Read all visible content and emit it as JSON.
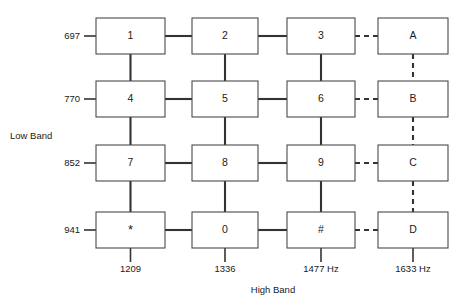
{
  "diagram": {
    "low_band_caption": "Low Band",
    "high_band_caption": "High Band",
    "line_color": "#333333",
    "box_stroke_color": "#4a4a4a",
    "background_color": "#ffffff"
  },
  "low_band": {
    "caption": "Low Band",
    "frequencies": [
      {
        "value": "697"
      },
      {
        "value": "770"
      },
      {
        "value": "852"
      },
      {
        "value": "941"
      }
    ]
  },
  "high_band": {
    "caption": "High Band",
    "frequencies": [
      {
        "value": "1209"
      },
      {
        "value": "1336"
      },
      {
        "value": "1477 Hz"
      },
      {
        "value": "1633 Hz"
      }
    ]
  },
  "keys": [
    {
      "label": "1",
      "row": 0,
      "col": 0,
      "optional": false
    },
    {
      "label": "2",
      "row": 0,
      "col": 1,
      "optional": false
    },
    {
      "label": "3",
      "row": 0,
      "col": 2,
      "optional": false
    },
    {
      "label": "A",
      "row": 0,
      "col": 3,
      "optional": true
    },
    {
      "label": "4",
      "row": 1,
      "col": 0,
      "optional": false
    },
    {
      "label": "5",
      "row": 1,
      "col": 1,
      "optional": false
    },
    {
      "label": "6",
      "row": 1,
      "col": 2,
      "optional": false
    },
    {
      "label": "B",
      "row": 1,
      "col": 3,
      "optional": true
    },
    {
      "label": "7",
      "row": 2,
      "col": 0,
      "optional": false
    },
    {
      "label": "8",
      "row": 2,
      "col": 1,
      "optional": false
    },
    {
      "label": "9",
      "row": 2,
      "col": 2,
      "optional": false
    },
    {
      "label": "C",
      "row": 2,
      "col": 3,
      "optional": true
    },
    {
      "label": "*",
      "row": 3,
      "col": 0,
      "optional": false
    },
    {
      "label": "0",
      "row": 3,
      "col": 1,
      "optional": false
    },
    {
      "label": "#",
      "row": 3,
      "col": 2,
      "optional": false
    },
    {
      "label": "D",
      "row": 3,
      "col": 3,
      "optional": true
    }
  ]
}
